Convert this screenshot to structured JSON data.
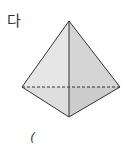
{
  "figure": {
    "label": "다",
    "shape": "triangular-pyramid",
    "vertices": {
      "apex": [
        69,
        21
      ],
      "left": [
        22,
        87
      ],
      "right": [
        120,
        87
      ],
      "front": [
        69,
        117
      ]
    },
    "colors": {
      "edge": "#333333",
      "left_face": "#e6e6e6",
      "right_face": "#d6d6d6",
      "base_left": "#dcdcdc",
      "base_right": "#cfcfcf"
    }
  },
  "answer_blank": {
    "open_paren": "("
  }
}
